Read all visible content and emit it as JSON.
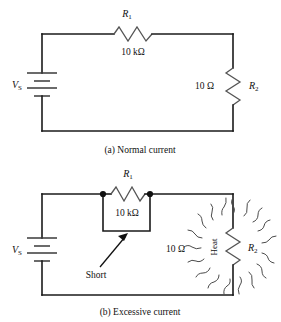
{
  "figure": {
    "title_text": "",
    "background_color": "#ffffff",
    "line_color": "#1a1a1a",
    "component_color": "#555555"
  },
  "circuit_a": {
    "caption": "(a) Normal current",
    "source_label": "V",
    "source_subscript": "S",
    "r1_label": "R",
    "r1_subscript": "1",
    "r1_value": "10 kΩ",
    "r2_label": "R",
    "r2_subscript": "2",
    "r2_value": "10 Ω"
  },
  "circuit_b": {
    "caption": "(b) Excessive current",
    "source_label": "V",
    "source_subscript": "S",
    "r1_label": "R",
    "r1_subscript": "1",
    "r1_value": "10 kΩ",
    "r2_label": "R",
    "r2_subscript": "2",
    "r2_value": "10 Ω",
    "short_label": "Short",
    "heat_label": "Heat"
  }
}
